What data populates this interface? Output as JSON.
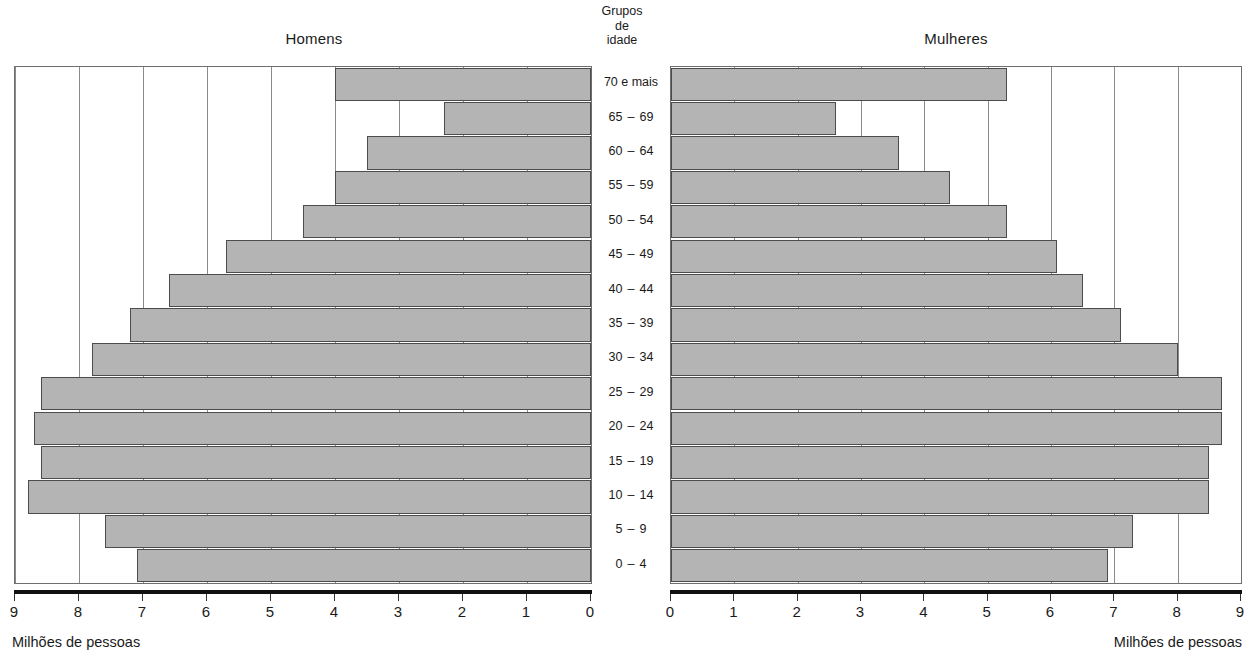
{
  "panels": {
    "left_title": "Homens",
    "right_title": "Mulheres"
  },
  "center_header": {
    "line1": "Grupos",
    "line2": "de",
    "line3": "idade"
  },
  "axis": {
    "caption_left": "Milhões de pessoas",
    "caption_right": "Milhões de pessoas",
    "left_ticks": [
      "9",
      "8",
      "7",
      "6",
      "5",
      "4",
      "3",
      "2",
      "1",
      "0"
    ],
    "right_ticks": [
      "0",
      "1",
      "2",
      "3",
      "4",
      "5",
      "6",
      "7",
      "8",
      "9"
    ]
  },
  "age_groups": [
    {
      "label": "70 e mais",
      "from": "",
      "to": "",
      "single": true
    },
    {
      "label": "65 – 69",
      "from": "65",
      "to": "69",
      "single": false
    },
    {
      "label": "60 – 64",
      "from": "60",
      "to": "64",
      "single": false
    },
    {
      "label": "55 – 59",
      "from": "55",
      "to": "59",
      "single": false
    },
    {
      "label": "50 – 54",
      "from": "50",
      "to": "54",
      "single": false
    },
    {
      "label": "45 – 49",
      "from": "45",
      "to": "49",
      "single": false
    },
    {
      "label": "40 – 44",
      "from": "40",
      "to": "44",
      "single": false
    },
    {
      "label": "35 – 39",
      "from": "35",
      "to": "39",
      "single": false
    },
    {
      "label": "30 – 34",
      "from": "30",
      "to": "34",
      "single": false
    },
    {
      "label": "25 – 29",
      "from": "25",
      "to": "29",
      "single": false
    },
    {
      "label": "20 – 24",
      "from": "20",
      "to": "24",
      "single": false
    },
    {
      "label": "15 – 19",
      "from": "15",
      "to": "19",
      "single": false
    },
    {
      "label": "10 – 14",
      "from": "10",
      "to": "14",
      "single": false
    },
    {
      "label": "5 – 9",
      "from": "5",
      "to": "9",
      "single": false
    },
    {
      "label": "0 – 4",
      "from": "0",
      "to": "4",
      "single": false
    }
  ],
  "colors": {
    "bar_fill": "#b4b4b4",
    "bar_stroke": "#4c4c4c",
    "grid": "#8a8a8a",
    "frame": "#6e6e6e",
    "axis": "#111111",
    "text": "#1a1a1a"
  },
  "chart_data": {
    "type": "bar",
    "subtype": "population-pyramid",
    "title": "",
    "xlabel": "Milhões de pessoas",
    "ylabel": "Grupos de idade",
    "xlim": [
      0,
      9
    ],
    "grid": true,
    "legend": "none",
    "categories": [
      "70 e mais",
      "65 – 69",
      "60 – 64",
      "55 – 59",
      "50 – 54",
      "45 – 49",
      "40 – 44",
      "35 – 39",
      "30 – 34",
      "25 – 29",
      "20 – 24",
      "15 – 19",
      "10 – 14",
      "5 – 9",
      "0 – 4"
    ],
    "series": [
      {
        "name": "Homens",
        "side": "left",
        "axis_direction": "reversed",
        "values": [
          4.0,
          2.3,
          3.5,
          4.0,
          4.5,
          5.7,
          6.6,
          7.2,
          7.8,
          8.6,
          8.7,
          8.6,
          8.8,
          7.6,
          7.1
        ]
      },
      {
        "name": "Mulheres",
        "side": "right",
        "axis_direction": "normal",
        "values": [
          5.3,
          2.6,
          3.6,
          4.4,
          5.3,
          6.1,
          6.5,
          7.1,
          8.0,
          8.7,
          8.7,
          8.5,
          8.5,
          7.3,
          6.9
        ]
      }
    ]
  }
}
